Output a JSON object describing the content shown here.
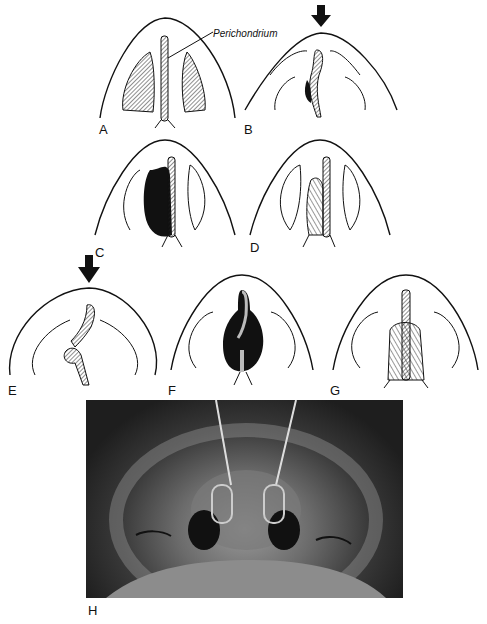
{
  "figure": {
    "panels": [
      {
        "id": "A",
        "label": "A"
      },
      {
        "id": "B",
        "label": "B"
      },
      {
        "id": "C",
        "label": "C"
      },
      {
        "id": "D",
        "label": "D"
      },
      {
        "id": "E",
        "label": "E"
      },
      {
        "id": "F",
        "label": "F"
      },
      {
        "id": "G",
        "label": "G"
      },
      {
        "id": "H",
        "label": "H"
      }
    ],
    "annotation": "Perichondrium",
    "arrows": [
      "B",
      "E"
    ],
    "photo_description": "Surgical photograph: view from below of patient's nose with two retractors in nostrils"
  }
}
